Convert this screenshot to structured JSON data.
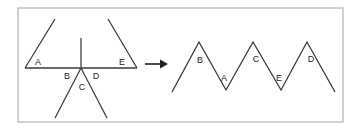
{
  "figure": {
    "canvas": {
      "width": 356,
      "height": 133,
      "background": "#ffffff"
    },
    "frame": {
      "x": 18,
      "y": 8,
      "width": 325,
      "height": 114,
      "stroke": "#c8c8c8"
    },
    "colors": {
      "stroke": "#3a3a3a",
      "arrow": "#1e1e1e",
      "label": "#1e1e1e",
      "frame": "#c8c8c8",
      "background": "#ffffff"
    },
    "left_diagram": {
      "name": "star-of-rays-at-point",
      "vertex": {
        "x": 81,
        "y": 68
      },
      "rays": [
        {
          "name": "ray-left-horizontal",
          "x1": 25,
          "y1": 68,
          "x2": 81,
          "y2": 68
        },
        {
          "name": "ray-right-horizontal",
          "x1": 81,
          "y1": 68,
          "x2": 137,
          "y2": 68
        },
        {
          "name": "ray-upper-left-diagonal",
          "x1": 25,
          "y1": 68,
          "x2": 55,
          "y2": 19
        },
        {
          "name": "ray-upper-right-diagonal",
          "x1": 137,
          "y1": 68,
          "x2": 108,
          "y2": 19
        },
        {
          "name": "ray-vertical-up",
          "x1": 81,
          "y1": 68,
          "x2": 81,
          "y2": 38
        },
        {
          "name": "ray-lower-left-diagonal",
          "x1": 81,
          "y1": 68,
          "x2": 55,
          "y2": 118
        },
        {
          "name": "ray-lower-right-diagonal",
          "x1": 81,
          "y1": 68,
          "x2": 107,
          "y2": 118
        }
      ],
      "labels": [
        {
          "id": "A",
          "text": "A",
          "x": 38,
          "y": 63
        },
        {
          "id": "B",
          "text": "B",
          "x": 67,
          "y": 77
        },
        {
          "id": "C",
          "text": "C",
          "x": 82,
          "y": 88
        },
        {
          "id": "D",
          "text": "D",
          "x": 96,
          "y": 77
        },
        {
          "id": "E",
          "text": "E",
          "x": 122,
          "y": 63
        }
      ]
    },
    "arrow": {
      "name": "transform-arrow",
      "shaft": {
        "x1": 145,
        "y1": 64,
        "x2": 164,
        "y2": 64
      },
      "head": "168,64 161,60 161,68"
    },
    "right_diagram": {
      "name": "zigzag-chain",
      "points": "172,92 199,42 226,90 253,42 281,90 307,42 335,92",
      "vertices": [
        {
          "id": "start",
          "x": 172,
          "y": 92,
          "kind": "endpoint"
        },
        {
          "id": "peak-1",
          "x": 199,
          "y": 42,
          "kind": "peak"
        },
        {
          "id": "valley-1",
          "x": 226,
          "y": 90,
          "kind": "valley"
        },
        {
          "id": "peak-2",
          "x": 253,
          "y": 42,
          "kind": "peak"
        },
        {
          "id": "valley-2",
          "x": 281,
          "y": 90,
          "kind": "valley"
        },
        {
          "id": "peak-3",
          "x": 307,
          "y": 42,
          "kind": "peak"
        },
        {
          "id": "end",
          "x": 335,
          "y": 92,
          "kind": "endpoint"
        }
      ],
      "labels": [
        {
          "id": "B",
          "text": "B",
          "x": 200,
          "y": 61
        },
        {
          "id": "A",
          "text": "A",
          "x": 224,
          "y": 79
        },
        {
          "id": "C",
          "text": "C",
          "x": 256,
          "y": 60
        },
        {
          "id": "E",
          "text": "E",
          "x": 279,
          "y": 79
        },
        {
          "id": "D",
          "text": "D",
          "x": 311,
          "y": 60
        }
      ]
    }
  }
}
